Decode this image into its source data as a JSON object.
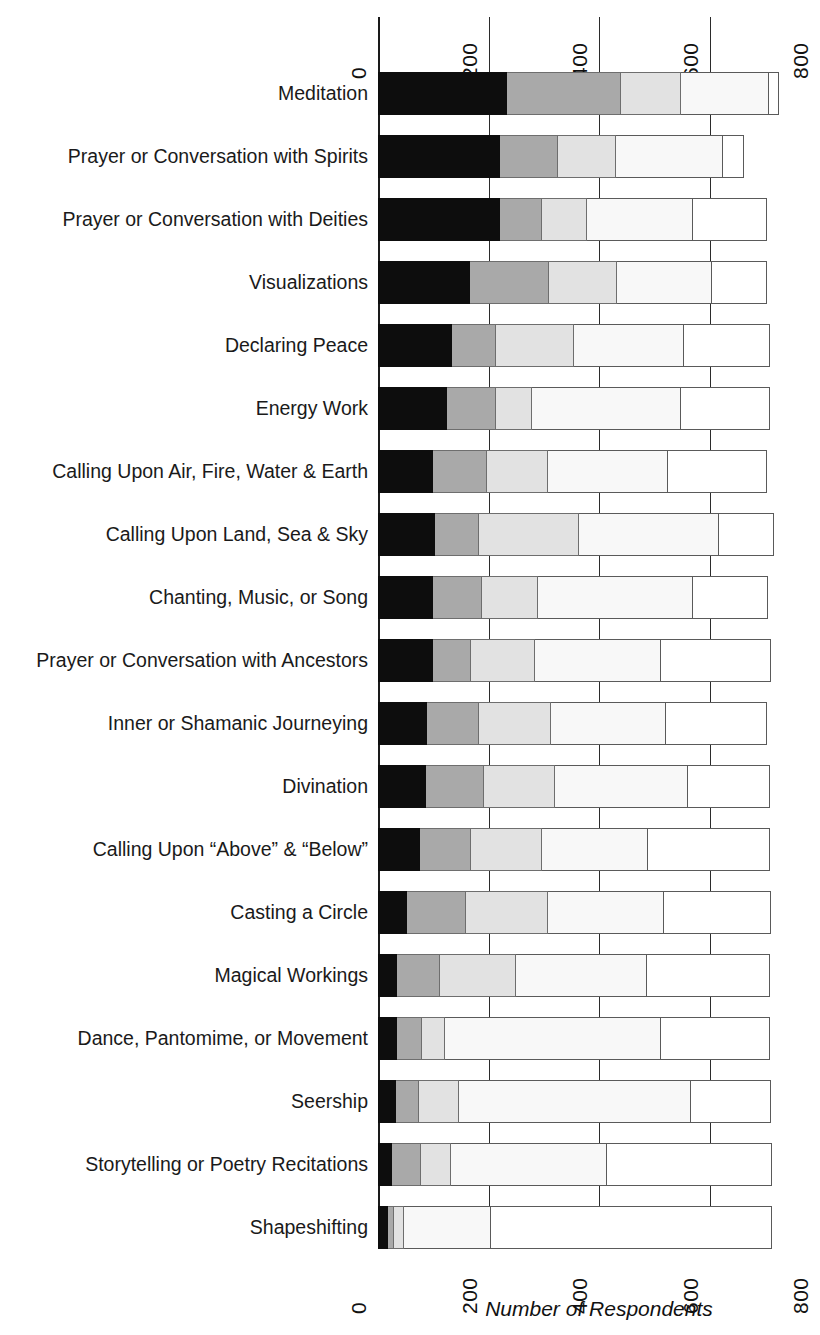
{
  "chart_data": {
    "type": "bar",
    "orientation": "horizontal",
    "stacked": true,
    "title": "",
    "xlabel": "Number of Respondents",
    "ylabel": "",
    "xlim": [
      0,
      800
    ],
    "xticks": [
      "0",
      "200",
      "400",
      "600",
      "800"
    ],
    "xtick_values": [
      0,
      200,
      400,
      600,
      800
    ],
    "grid": true,
    "legend": "none",
    "axis_top_ticks": [
      "0",
      "200",
      "400",
      "600",
      "800"
    ],
    "axis_bottom_ticks": [
      "0",
      "200",
      "400",
      "600",
      "800"
    ],
    "series": [
      {
        "name": "Segment 1",
        "color": "#0d0d0d"
      },
      {
        "name": "Segment 2",
        "color": "#a9a9a9"
      },
      {
        "name": "Segment 3",
        "color": "#e2e2e2"
      },
      {
        "name": "Segment 4",
        "color": "#f8f8f8"
      },
      {
        "name": "Segment 5",
        "color": "#ffffff"
      }
    ],
    "categories": [
      "Meditation",
      "Prayer or Conversation with Spirits",
      "Prayer or Conversation with Deities",
      "Visualizations",
      "Declaring Peace",
      "Energy Work",
      "Calling Upon Air, Fire, Water & Earth",
      "Calling Upon Land, Sea & Sky",
      "Chanting, Music, or Song",
      "Prayer or Conversation with Ancestors",
      "Inner or Shamanic Journeying",
      "Divination",
      "Calling Upon “Above” & “Below”",
      "Casting a Circle",
      "Magical Workings",
      "Dance, Pantomime, or Movement",
      "Seership",
      "Storytelling or Poetry Recitations",
      "Shapeshifting"
    ],
    "rows": [
      {
        "category": "Meditation",
        "values": [
          234,
          205,
          109,
          159,
          18
        ],
        "total": 725
      },
      {
        "category": "Prayer or Conversation with Spirits",
        "values": [
          221,
          104,
          106,
          194,
          37
        ],
        "total": 662
      },
      {
        "category": "Prayer or Conversation with Deities",
        "values": [
          221,
          76,
          82,
          191,
          135
        ],
        "total": 705
      },
      {
        "category": "Visualizations",
        "values": [
          166,
          143,
          123,
          173,
          100
        ],
        "total": 705
      },
      {
        "category": "Declaring Peace",
        "values": [
          134,
          79,
          141,
          200,
          155
        ],
        "total": 709
      },
      {
        "category": "Energy Work",
        "values": [
          125,
          89,
          65,
          270,
          160
        ],
        "total": 709
      },
      {
        "category": "Calling Upon Air, Fire, Water & Earth",
        "values": [
          100,
          98,
          109,
          218,
          180
        ],
        "total": 705
      },
      {
        "category": "Calling Upon Land, Sea & Sky",
        "values": [
          104,
          78,
          182,
          253,
          100
        ],
        "total": 717
      },
      {
        "category": "Chanting, Music, or Song",
        "values": [
          100,
          89,
          101,
          281,
          135
        ],
        "total": 706
      },
      {
        "category": "Prayer or Conversation with Ancestors",
        "values": [
          100,
          68,
          116,
          229,
          199
        ],
        "total": 712
      },
      {
        "category": "Inner or Shamanic Journeying",
        "values": [
          89,
          93,
          132,
          208,
          182
        ],
        "total": 704
      },
      {
        "category": "Divination",
        "values": [
          86,
          105,
          130,
          240,
          148
        ],
        "total": 709
      },
      {
        "category": "Calling Upon “Above” & “Below”",
        "values": [
          76,
          93,
          127,
          192,
          221
        ],
        "total": 709
      },
      {
        "category": "Casting a Circle",
        "values": [
          52,
          107,
          148,
          211,
          194
        ],
        "total": 712
      },
      {
        "category": "Magical Workings",
        "values": [
          34,
          79,
          137,
          237,
          222
        ],
        "total": 709
      },
      {
        "category": "Dance, Pantomime, or Movement",
        "values": [
          34,
          45,
          43,
          390,
          197
        ],
        "total": 709
      },
      {
        "category": "Seership",
        "values": [
          32,
          43,
          71,
          420,
          146
        ],
        "total": 712
      },
      {
        "category": "Storytelling or Poetry Recitations",
        "values": [
          25,
          52,
          55,
          283,
          298
        ],
        "total": 713
      },
      {
        "category": "Shapeshifting",
        "values": [
          18,
          11,
          18,
          157,
          509
        ],
        "total": 713
      }
    ]
  },
  "axis": {
    "x_title": "Number of Respondents",
    "ticks": [
      "0",
      "200",
      "400",
      "600",
      "800"
    ]
  }
}
